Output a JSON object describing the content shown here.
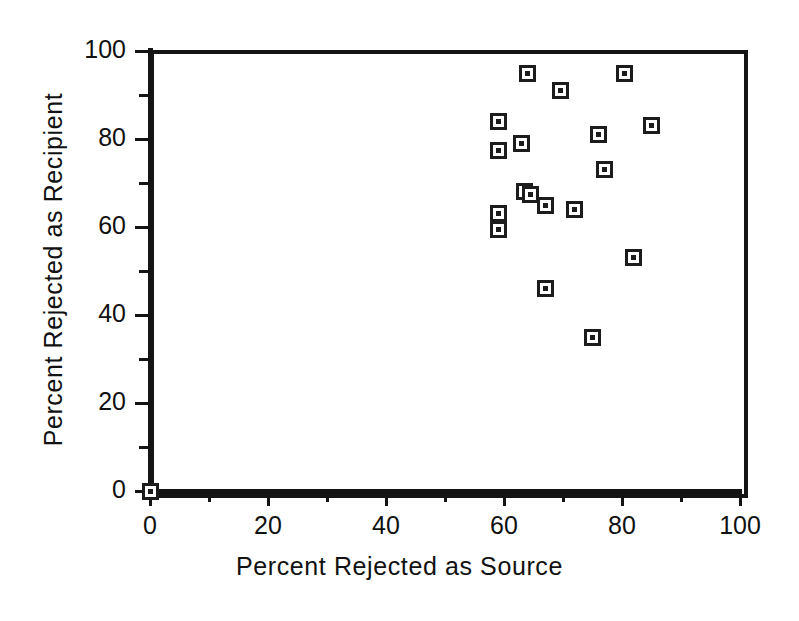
{
  "chart_data": {
    "type": "scatter",
    "title": "",
    "xlabel": "Percent Rejected as Source",
    "ylabel": "Percent Rejected as Recipient",
    "xlim": [
      0,
      100
    ],
    "ylim": [
      0,
      100
    ],
    "grid": false,
    "legend": null,
    "x_ticks_major": [
      0,
      20,
      40,
      60,
      80,
      100
    ],
    "x_ticks_minor": [
      10,
      30,
      50,
      70,
      90
    ],
    "y_ticks_major": [
      0,
      20,
      40,
      60,
      80,
      100
    ],
    "y_ticks_minor": [
      10,
      30,
      50,
      70,
      90
    ],
    "x_tick_labels": [
      "0",
      "20",
      "40",
      "60",
      "80",
      "100"
    ],
    "y_tick_labels": [
      "0",
      "20",
      "40",
      "60",
      "80",
      "100"
    ],
    "marker_style": "open-square-with-center-dot",
    "marker_color": "#1c1c1c",
    "points": [
      {
        "x": 0,
        "y": 0
      },
      {
        "x": 59,
        "y": 84
      },
      {
        "x": 59,
        "y": 77.5
      },
      {
        "x": 63,
        "y": 79
      },
      {
        "x": 64,
        "y": 95
      },
      {
        "x": 69.5,
        "y": 91
      },
      {
        "x": 80.5,
        "y": 95
      },
      {
        "x": 85,
        "y": 83
      },
      {
        "x": 76,
        "y": 81
      },
      {
        "x": 77,
        "y": 73
      },
      {
        "x": 63.5,
        "y": 68
      },
      {
        "x": 64.5,
        "y": 67.5
      },
      {
        "x": 67,
        "y": 65
      },
      {
        "x": 72,
        "y": 64
      },
      {
        "x": 59,
        "y": 63
      },
      {
        "x": 59,
        "y": 59.5
      },
      {
        "x": 82,
        "y": 53
      },
      {
        "x": 67,
        "y": 46
      },
      {
        "x": 75,
        "y": 35
      }
    ]
  },
  "axes": {
    "x_title": "Percent Rejected as Source",
    "y_title": "Percent Rejected as Recipient"
  }
}
